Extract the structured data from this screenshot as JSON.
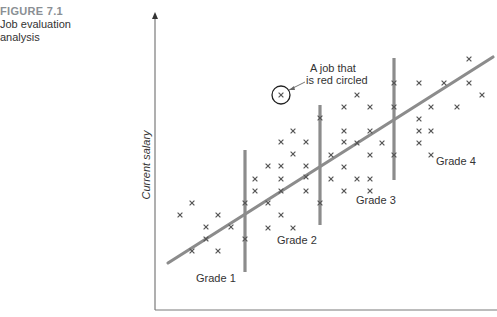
{
  "figure": {
    "number": "FIGURE 7.1",
    "title_line1": "Job evaluation",
    "title_line2": "analysis"
  },
  "colors": {
    "axis": "#7a7a7a",
    "line": "#8c8c8c",
    "marker": "#555555",
    "text": "#333333",
    "figure_number": "#8a8f94"
  },
  "chart_data": {
    "type": "scatter",
    "title": "Job evaluation analysis",
    "xlabel": "",
    "ylabel": "Current salary",
    "grid": false,
    "legend": null,
    "axis": {
      "x_from": [
        155,
        310
      ],
      "x_to": [
        497,
        310
      ],
      "y_from": [
        155,
        310
      ],
      "y_to": [
        155,
        12
      ]
    },
    "regression_line": {
      "x1": 168,
      "y1": 263,
      "x2": 493,
      "y2": 57
    },
    "grade_boundaries": [
      {
        "x": 245,
        "y1": 150,
        "y2": 272
      },
      {
        "x": 320,
        "y1": 105,
        "y2": 225
      },
      {
        "x": 394,
        "y1": 58,
        "y2": 180
      }
    ],
    "grade_labels": [
      {
        "text": "Grade 1",
        "x": 196,
        "y": 282
      },
      {
        "text": "Grade 2",
        "x": 277,
        "y": 244
      },
      {
        "text": "Grade 3",
        "x": 356,
        "y": 204
      },
      {
        "text": "Grade 4",
        "x": 436,
        "y": 165
      }
    ],
    "annotation": {
      "line1": "A job that",
      "line2": "is red circled",
      "circle": {
        "cx": 281,
        "cy": 95,
        "r": 9
      },
      "text_x": 310,
      "text_y1": 72,
      "text_y2": 84,
      "pointer": {
        "x1": 305,
        "y1": 82,
        "x2": 289,
        "y2": 90
      }
    },
    "points": [
      [
        192,
        203
      ],
      [
        180,
        215
      ],
      [
        218,
        215
      ],
      [
        206,
        227
      ],
      [
        231,
        227
      ],
      [
        206,
        239
      ],
      [
        192,
        251
      ],
      [
        218,
        251
      ],
      [
        245,
        203
      ],
      [
        245,
        239
      ],
      [
        293,
        131
      ],
      [
        281,
        142
      ],
      [
        306,
        142
      ],
      [
        293,
        154
      ],
      [
        268,
        166
      ],
      [
        281,
        166
      ],
      [
        306,
        166
      ],
      [
        255,
        179
      ],
      [
        281,
        179
      ],
      [
        306,
        177
      ],
      [
        255,
        191
      ],
      [
        281,
        191
      ],
      [
        306,
        191
      ],
      [
        268,
        203
      ],
      [
        281,
        215
      ],
      [
        268,
        228
      ],
      [
        293,
        228
      ],
      [
        357,
        95
      ],
      [
        344,
        107
      ],
      [
        370,
        107
      ],
      [
        320,
        118
      ],
      [
        344,
        131
      ],
      [
        370,
        131
      ],
      [
        344,
        142
      ],
      [
        357,
        143
      ],
      [
        382,
        143
      ],
      [
        331,
        155
      ],
      [
        370,
        155
      ],
      [
        344,
        167
      ],
      [
        331,
        179
      ],
      [
        357,
        179
      ],
      [
        370,
        179
      ],
      [
        344,
        191
      ],
      [
        370,
        191
      ],
      [
        320,
        203
      ],
      [
        469,
        59
      ],
      [
        394,
        83
      ],
      [
        419,
        83
      ],
      [
        444,
        83
      ],
      [
        469,
        83
      ],
      [
        482,
        95
      ],
      [
        394,
        107
      ],
      [
        431,
        107
      ],
      [
        457,
        107
      ],
      [
        419,
        119
      ],
      [
        419,
        131
      ],
      [
        431,
        131
      ],
      [
        419,
        143
      ],
      [
        394,
        155
      ],
      [
        431,
        155
      ],
      [
        281,
        95
      ]
    ]
  }
}
